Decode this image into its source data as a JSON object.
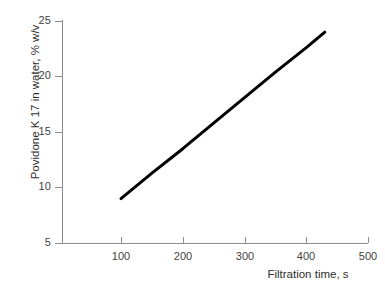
{
  "chart_data": {
    "type": "line",
    "title": "",
    "xlabel": "Filtration time, s",
    "ylabel": "Povidone K 17 in water, % w/v",
    "xlim": [
      50,
      500
    ],
    "ylim": [
      5,
      25
    ],
    "xticks": [
      100,
      200,
      300,
      400,
      500
    ],
    "xticklabels": [
      "100",
      "200",
      "300",
      "400",
      "500"
    ],
    "yticks": [
      5,
      10,
      15,
      20,
      25
    ],
    "yticklabels": [
      "5",
      "10",
      "15",
      "20",
      "25"
    ],
    "grid": false,
    "legend": "none",
    "series": [
      {
        "name": "Povidone K 17 solubility vs filtration time",
        "color": "#000000",
        "linewidth": 3,
        "x": [
          100,
          430
        ],
        "y": [
          9.0,
          24.0
        ],
        "points": [
          {
            "x": 100,
            "y": 9.0
          },
          {
            "x": 150,
            "y": 11.3
          },
          {
            "x": 200,
            "y": 13.5
          },
          {
            "x": 250,
            "y": 15.8
          },
          {
            "x": 300,
            "y": 18.1
          },
          {
            "x": 350,
            "y": 20.4
          },
          {
            "x": 400,
            "y": 22.6
          },
          {
            "x": 430,
            "y": 24.0
          }
        ]
      }
    ],
    "axis_color": "#8c8c8c",
    "text_color": "#3a3a3a",
    "background": "#ffffff"
  }
}
